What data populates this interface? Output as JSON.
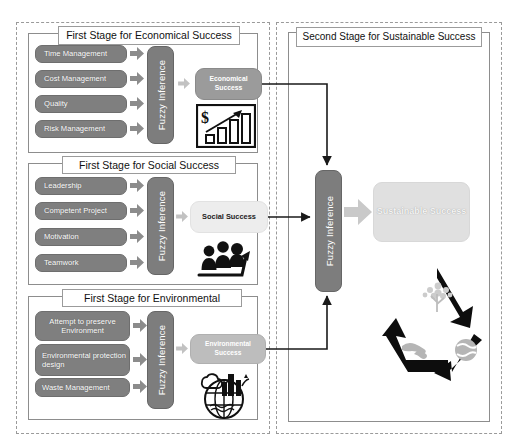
{
  "diagram": {
    "left_region_label": "First Stages region",
    "right_region_label": "Second Stage region"
  },
  "colors": {
    "input_pill": "#7f7f7f",
    "fuzzy_block": "#7d7d7d",
    "economical_output": "#9b9b9b",
    "social_output": "#ededed",
    "environmental_output": "#bdbdbd",
    "sustainable_output": "#e0e0e0",
    "arrow_gray": "#b3b3b3",
    "connector_line": "#1a1a1a",
    "frame_dashed": "#9a9a9a"
  },
  "stages": [
    {
      "id": "economical",
      "caption": "First Stage for Economical Success",
      "inputs": [
        "Time Management",
        "Cost Management",
        "Quality",
        "Risk Management"
      ],
      "engine_label": "Fuzzy Inference",
      "output_label": "Economical Success",
      "icon": "bar-chart-dollar-growth-icon"
    },
    {
      "id": "social",
      "caption": "First Stage for Social Success",
      "inputs": [
        "Leadership",
        "Competent Project",
        "Motivation",
        "Teamwork"
      ],
      "engine_label": "Fuzzy Inference",
      "output_label": "Social Success",
      "icon": "people-growth-arrow-icon"
    },
    {
      "id": "environmental",
      "caption": "First Stage for Environmental",
      "inputs": [
        "Attempt to preserve Environment",
        "Environmental protection design",
        "Waste Management"
      ],
      "engine_label": "Fuzzy Inference",
      "output_label": "Environmental Success",
      "icon": "globe-city-nature-icon"
    }
  ],
  "second_stage": {
    "caption": "Second Stage for Sustainable Success",
    "engine_label": "Fuzzy Inference",
    "output_label": "Sustainable Success",
    "icon": "recycle-triangle-icon",
    "recycle_symbols": [
      "tree-icon",
      "handshake-icon",
      "earth-icon"
    ]
  }
}
